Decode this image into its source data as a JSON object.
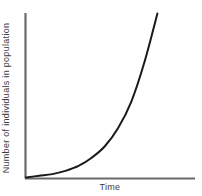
{
  "figure": {
    "background_color": "#ffffff",
    "width": 202,
    "height": 196
  },
  "axes": {
    "color": "#6a6a6a",
    "x_label": "Time",
    "y_label": "Number of individuals in population",
    "origin": {
      "x": 25,
      "y": 178
    },
    "y_axis_top": 13,
    "x_axis_right": 195
  },
  "curve": {
    "color": "#1a1a1a",
    "width": 2
  },
  "chart_data": {
    "type": "line",
    "title": "",
    "xlabel": "Time",
    "ylabel": "Number of individuals in population",
    "xlim": [
      0,
      1
    ],
    "ylim": [
      0,
      1
    ],
    "grid": false,
    "legend": null,
    "tick_labels": {
      "x": [],
      "y": []
    },
    "annotations": [],
    "series": [
      {
        "name": "Exponential growth",
        "x": [
          0.0,
          0.1,
          0.2,
          0.3,
          0.4,
          0.5,
          0.6,
          0.7,
          0.8,
          0.9,
          1.0
        ],
        "y": [
          0.0,
          0.01,
          0.02,
          0.04,
          0.07,
          0.12,
          0.19,
          0.3,
          0.46,
          0.7,
          1.0
        ]
      }
    ]
  }
}
